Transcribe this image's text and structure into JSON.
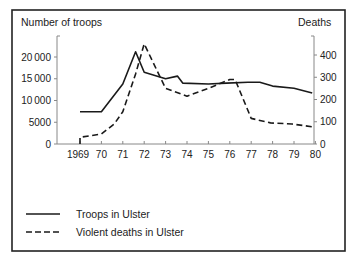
{
  "chart_data": {
    "type": "line",
    "title": "",
    "xlabel": "",
    "ylabel": "Number of troops",
    "ylabel_right": "Deaths",
    "x_ticks": [
      "1969",
      "70",
      "71",
      "72",
      "73",
      "74",
      "75",
      "76",
      "77",
      "78",
      "79",
      "80"
    ],
    "y_ticks_left": [
      "0",
      "5000",
      "10000",
      "15000",
      "20000"
    ],
    "y_ticks_right": [
      "0",
      "100",
      "200",
      "300",
      "400"
    ],
    "ylim_left": [
      0,
      25000
    ],
    "ylim_right": [
      0,
      500
    ],
    "grid": false,
    "legend_position": "bottom-left",
    "series": [
      {
        "name": "Troops in Ulster",
        "axis": "left",
        "style": "solid",
        "x": [
          1969.0,
          1970.0,
          1971.0,
          1971.6,
          1972.0,
          1973.0,
          1973.55,
          1973.8,
          1975.0,
          1975.85,
          1976.85,
          1977.4,
          1978.0,
          1979.0,
          1979.85
        ],
        "values": [
          7400,
          7400,
          13800,
          21200,
          16500,
          15000,
          15600,
          14000,
          13800,
          14000,
          14200,
          14200,
          13300,
          12800,
          11700
        ]
      },
      {
        "name": "Violent deaths in Ulster",
        "axis": "right",
        "style": "dashed",
        "x": [
          1969.0,
          1969.0,
          1970.0,
          1970.6,
          1971.0,
          1971.6,
          1972.0,
          1973.0,
          1974.0,
          1975.0,
          1976.0,
          1976.25,
          1977.0,
          1977.9,
          1978.9,
          1979.9
        ],
        "values": [
          0,
          30,
          45,
          90,
          145,
          315,
          450,
          250,
          215,
          250,
          290,
          290,
          115,
          95,
          90,
          77
        ]
      }
    ]
  },
  "legend": {
    "items": [
      {
        "label": "Troops in Ulster",
        "style": "solid"
      },
      {
        "label": "Violent deaths in Ulster",
        "style": "dashed"
      }
    ]
  },
  "colors": {
    "line": "#1a1a1a",
    "axis": "#888888",
    "border": "#222222"
  }
}
